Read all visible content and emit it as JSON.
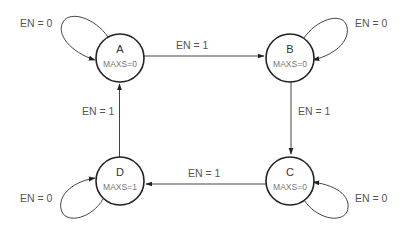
{
  "diagram": {
    "type": "state-machine",
    "states": [
      {
        "id": "A",
        "name": "A",
        "output": "MAXS=0"
      },
      {
        "id": "B",
        "name": "B",
        "output": "MAXS=0"
      },
      {
        "id": "C",
        "name": "C",
        "output": "MAXS=0"
      },
      {
        "id": "D",
        "name": "D",
        "output": "MAXS=1"
      }
    ],
    "transitions": [
      {
        "from": "A",
        "to": "A",
        "label": "EN = 0"
      },
      {
        "from": "A",
        "to": "B",
        "label": "EN = 1"
      },
      {
        "from": "B",
        "to": "B",
        "label": "EN = 0"
      },
      {
        "from": "B",
        "to": "C",
        "label": "EN = 1"
      },
      {
        "from": "C",
        "to": "C",
        "label": "EN = 0"
      },
      {
        "from": "C",
        "to": "D",
        "label": "EN = 1"
      },
      {
        "from": "D",
        "to": "D",
        "label": "EN = 0"
      },
      {
        "from": "D",
        "to": "A",
        "label": "EN = 1"
      }
    ]
  }
}
